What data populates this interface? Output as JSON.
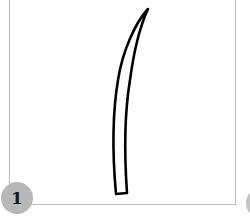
{
  "step": {
    "number": "1",
    "badge_color": "#b8b8b8",
    "frame_border_color": "#bdbdbd"
  },
  "illustration": {
    "subject": "curved-blade-outline",
    "stroke_color": "#000000"
  },
  "next_step_badge": {
    "partially_visible": true
  }
}
